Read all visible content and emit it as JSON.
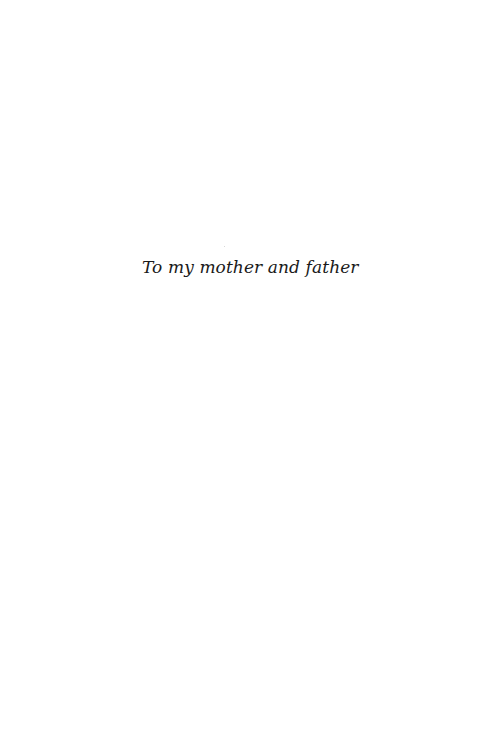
{
  "page": {
    "dedication": "To my mother and father"
  }
}
